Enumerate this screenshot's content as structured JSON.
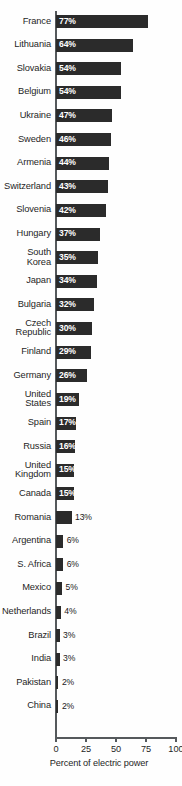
{
  "chart_data": {
    "type": "bar",
    "orientation": "horizontal",
    "title": "",
    "subtitle": "",
    "xlabel": "Percent of electric power",
    "ylabel": "",
    "xlim": [
      0,
      100
    ],
    "xticks": [
      0,
      25,
      50,
      75,
      100
    ],
    "xtick_labels": [
      "0",
      "25",
      "50",
      "75",
      "100"
    ],
    "grid": false,
    "legend": null,
    "value_suffix": "%",
    "bar_color": "#2b2b2b",
    "axis_color": "#55595c",
    "background_color": "#fefefe",
    "inside_label_color": "#ffffff",
    "outside_label_color": "#1a1a1a",
    "categories": [
      "France",
      "Lithuania",
      "Slovakia",
      "Belgium",
      "Ukraine",
      "Sweden",
      "Armenia",
      "Switzerland",
      "Slovenia",
      "Hungary",
      "South\nKorea",
      "Japan",
      "Bulgaria",
      "Czech\nRepublic",
      "Finland",
      "Germany",
      "United\nStates",
      "Spain",
      "Russia",
      "United\nKingdom",
      "Canada",
      "Romania",
      "Argentina",
      "S. Africa",
      "Mexico",
      "Netherlands",
      "Brazil",
      "India",
      "Pakistan",
      "China"
    ],
    "values": [
      77,
      64,
      54,
      54,
      47,
      46,
      44,
      43,
      42,
      37,
      35,
      34,
      32,
      30,
      29,
      26,
      19,
      17,
      16,
      15,
      15,
      13,
      6,
      6,
      5,
      4,
      3,
      3,
      2,
      2
    ],
    "value_labels": [
      "77%",
      "64%",
      "54%",
      "54%",
      "47%",
      "46%",
      "44%",
      "43%",
      "42%",
      "37%",
      "35%",
      "34%",
      "32%",
      "30%",
      "29%",
      "26%",
      "19%",
      "17%",
      "16%",
      "15%",
      "15%",
      "13%",
      "6%",
      "6%",
      "5%",
      "4%",
      "3%",
      "3%",
      "2%",
      "2%"
    ]
  }
}
